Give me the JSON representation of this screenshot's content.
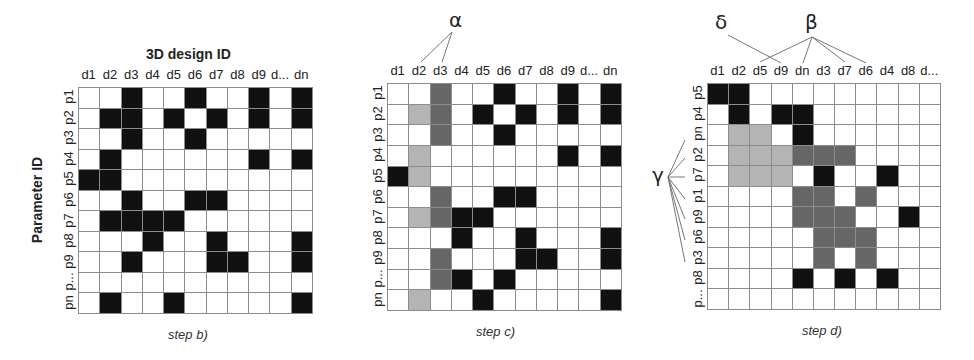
{
  "colors": {
    "black": "#111111",
    "light": "#b4b4b4",
    "dark": "#666666",
    "grid": "#8c8c8c"
  },
  "panel_b": {
    "title_x": "3D design ID",
    "title_y": "Parameter ID",
    "step_label": "step b)",
    "columns": [
      "d1",
      "d2",
      "d3",
      "d4",
      "d5",
      "d6",
      "d7",
      "d8",
      "d9",
      "d...",
      "dn"
    ],
    "rows": [
      "p1",
      "p2",
      "p3",
      "p4",
      "p5",
      "p6",
      "p7",
      "p8",
      "p9",
      "p...",
      "pn"
    ],
    "cells": [
      "..k..k..k.k",
      ".kk.k.k.k.k",
      "..k..k.....",
      ".k......k.k",
      "kk.........",
      "..k..kk....",
      ".kkkk......",
      "...k..k...k",
      "..k...kk..k",
      "...........",
      ".k..k.....k"
    ]
  },
  "panel_c": {
    "step_label": "step c)",
    "annotation_alpha": "α",
    "columns": [
      "d1",
      "d2",
      "d3",
      "d4",
      "d5",
      "d6",
      "d7",
      "d8",
      "d9",
      "d...",
      "dn"
    ],
    "rows": [
      "p1",
      "p2",
      "p3",
      "p4",
      "p5",
      "p6",
      "p7",
      "p8",
      "p9",
      "p...",
      "pn"
    ],
    "cells": [
      "..g..k..k.k",
      ".lg.k.k.k.k",
      "..g..k.....",
      ".l......k.k",
      "kl.........",
      "..g..kk....",
      ".lgkk......",
      "...k..k...k",
      "..g...kk..k",
      "..gk.k.....",
      ".l..k.....k"
    ]
  },
  "panel_d": {
    "step_label": "step d)",
    "annotation_delta": "δ",
    "annotation_beta": "β",
    "annotation_gamma": "γ",
    "columns": [
      "d1",
      "d2",
      "d5",
      "d9",
      "dn",
      "d3",
      "d7",
      "d6",
      "d4",
      "d8",
      "d..."
    ],
    "rows": [
      "p5",
      "p4",
      "pn",
      "p2",
      "p7",
      "p1",
      "p9",
      "p6",
      "p3",
      "p8",
      "p..."
    ],
    "cells": [
      "kk.........",
      ".k.kk......",
      ".ll.k......",
      ".lllggg....",
      ".lll.k..k..",
      "....gg.g...",
      "....ggg..k.",
      ".....ggg...",
      ".....g.g...",
      "....k.k.k..",
      "..........."
    ]
  }
}
